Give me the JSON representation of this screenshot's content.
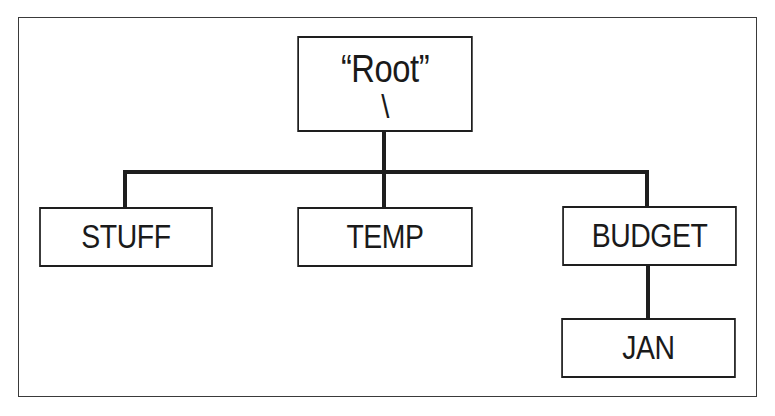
{
  "diagram": {
    "type": "directory-tree",
    "root": {
      "label": "“Root”",
      "separator": "\\"
    },
    "children": [
      {
        "label": "STUFF",
        "children": []
      },
      {
        "label": "TEMP",
        "children": []
      },
      {
        "label": "BUDGET",
        "children": [
          {
            "label": "JAN"
          }
        ]
      }
    ],
    "colors": {
      "line": "#1e1e1e",
      "background": "#ffffff",
      "frame": "#3a3a3a"
    }
  }
}
